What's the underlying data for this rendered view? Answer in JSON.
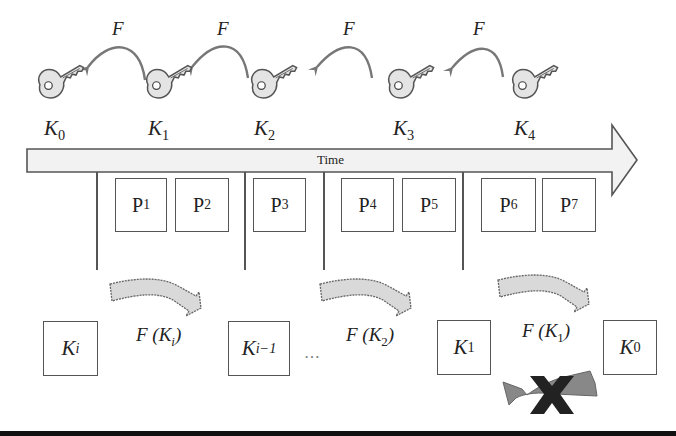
{
  "diagram": {
    "timeline": {
      "label": "Time",
      "colors": {
        "fill": "#f2f2f2",
        "stroke": "#555555"
      }
    },
    "keys_top": [
      {
        "name": "K",
        "sub": "0"
      },
      {
        "name": "K",
        "sub": "1"
      },
      {
        "name": "K",
        "sub": "2"
      },
      {
        "name": "K",
        "sub": "3"
      },
      {
        "name": "K",
        "sub": "4"
      }
    ],
    "function_arrows_top": [
      {
        "label": "F"
      },
      {
        "label": "F"
      },
      {
        "label": "F"
      },
      {
        "label": "F"
      }
    ],
    "packets": [
      {
        "name": "P",
        "sub": "1"
      },
      {
        "name": "P",
        "sub": "2"
      },
      {
        "name": "P",
        "sub": "3"
      },
      {
        "name": "P",
        "sub": "4"
      },
      {
        "name": "P",
        "sub": "5"
      },
      {
        "name": "P",
        "sub": "6"
      },
      {
        "name": "P",
        "sub": "7"
      }
    ],
    "keys_bottom": [
      {
        "name": "K",
        "sub": "i"
      },
      {
        "name": "K",
        "sub": "i−1"
      },
      {
        "name": "K",
        "sub": "1"
      },
      {
        "name": "K",
        "sub": "0"
      }
    ],
    "function_arrows_bottom": [
      {
        "prefix": "F (K",
        "sub": "i",
        "suffix": ")"
      },
      {
        "prefix": "F (K",
        "sub": "2",
        "suffix": ")"
      },
      {
        "prefix": "F (K",
        "sub": "1",
        "suffix": ")"
      }
    ],
    "ellipsis": "…",
    "blocked_arrow": {
      "meaning": "reverse derivation not possible",
      "mark": "X"
    },
    "colors": {
      "arrow_fill": "#d9d9d9",
      "arrow_stroke": "#666666",
      "curve_stroke": "#777777",
      "blocked_arrow_fill": "#888888",
      "x_mark": "#222222",
      "bottom_bar": "#111111"
    }
  }
}
